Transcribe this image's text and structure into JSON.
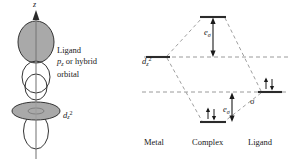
{
  "figure": {
    "kind": "molecular-orbital-interaction-diagram",
    "panels": [
      "orbital-overlap-sketch",
      "energy-level-diagram"
    ]
  },
  "orbital_panel": {
    "axis_label": "z",
    "axis_direction": "up",
    "ligand_caption": {
      "line1": "Ligand",
      "line2_base": "p",
      "line2_sub": "z",
      "line2_rest": " or hybrid",
      "line3": "orbital"
    },
    "metal_orbital_label": {
      "base": "d",
      "sub": "z",
      "sup": "2"
    },
    "lobes": [
      {
        "name": "ligand-pz-upper-lobe",
        "fill": "#a8a8a8",
        "stroke": "#333333"
      },
      {
        "name": "ligand-pz-lower-lobe",
        "fill": "#ffffff",
        "stroke": "#333333"
      },
      {
        "name": "dz2-upper-lobe",
        "fill": "#ffffff",
        "stroke": "#333333"
      },
      {
        "name": "dz2-lower-lobe",
        "fill": "#ffffff",
        "stroke": "#333333"
      },
      {
        "name": "dz2-torus",
        "fill": "#a8a8a8",
        "stroke": "#333333"
      }
    ],
    "colors": {
      "shaded_lobe": "#a8a8a8",
      "open_lobe": "#ffffff",
      "outline": "#333333",
      "axis": "#8a8a8a"
    }
  },
  "energy_diagram": {
    "levels": [
      {
        "name": "antibonding-sigma-star",
        "column": "Complex",
        "energy_px": 17,
        "electrons": "",
        "label": ""
      },
      {
        "name": "metal-d-z2",
        "column": "Metal",
        "energy_px": 57,
        "electrons": "",
        "label": "d z 2"
      },
      {
        "name": "ligand-sigma",
        "column": "Ligand",
        "energy_px": 92,
        "electrons": "up-down-pair",
        "label": "σ"
      },
      {
        "name": "bonding-sigma",
        "column": "Complex",
        "energy_px": 122,
        "electrons": "up-down-pair",
        "label": ""
      }
    ],
    "metal_level_label": {
      "base": "d",
      "sub": "z",
      "sup": "2"
    },
    "ligand_level_label": "σ",
    "splitting_labels": [
      {
        "name": "e-sigma-antibonding",
        "base": "e",
        "sub": "σ",
        "arrow": "double-headed-vertical"
      },
      {
        "name": "e-sigma-bonding",
        "base": "e",
        "sub": "σ",
        "arrow": "double-headed-vertical"
      }
    ],
    "electron_pair_glyph": "↑↓",
    "column_captions": [
      "Metal",
      "Complex",
      "Ligand"
    ],
    "colors": {
      "level_line": "#333333",
      "dashed_correlation": "#9a9a9a",
      "dashed_reference": "#9a9a9a",
      "arrow": "#1a1a1a"
    }
  }
}
